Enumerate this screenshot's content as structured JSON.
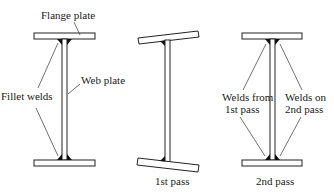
{
  "figure": {
    "beams": [
      {
        "id": "as-welded",
        "labels": {
          "flange": "Flange plate",
          "web": "Web plate",
          "welds": "Fillet welds"
        }
      },
      {
        "id": "first-pass",
        "caption": "1st pass"
      },
      {
        "id": "second-pass",
        "caption": "2nd pass",
        "labels": {
          "welds_first": "Welds from",
          "welds_first_2": "1st pass",
          "welds_second": "Welds on",
          "welds_second_2": "2nd pass"
        }
      }
    ],
    "colors": {
      "line": "#222222",
      "weld": "#111111",
      "background": "#ffffff"
    }
  }
}
